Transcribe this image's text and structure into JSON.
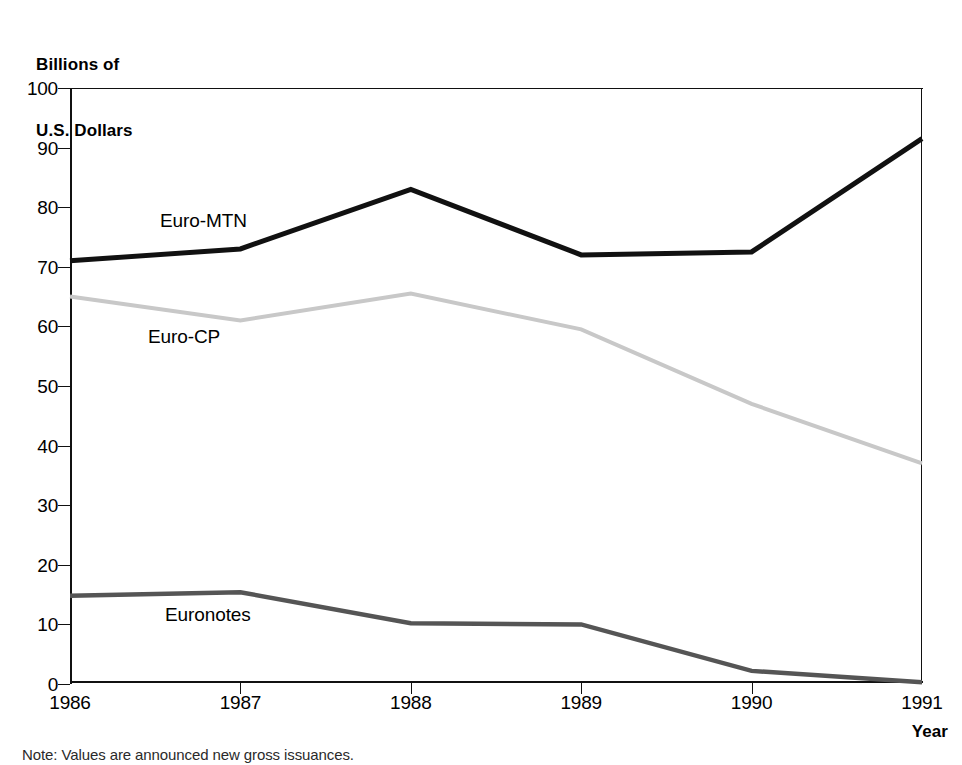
{
  "figure": {
    "y_axis_caption_line1": "Billions of",
    "y_axis_caption_line2": "U.S. Dollars",
    "x_axis_title": "Year",
    "footnote": "Note: Values are announced new gross issuances."
  },
  "series_labels": {
    "euro_mtn": "Euro-MTN",
    "euro_cp": "Euro-CP",
    "euronotes": "Euronotes"
  },
  "colors": {
    "euro_mtn": "#111111",
    "euro_cp": "#c8c8c8",
    "euronotes": "#555555",
    "axis": "#111111",
    "background": "#ffffff"
  },
  "chart_data": {
    "type": "line",
    "title": "",
    "subtitle": "",
    "xlabel": "Year",
    "ylabel": "Billions of U.S. Dollars",
    "categories": [
      "1986",
      "1987",
      "1988",
      "1989",
      "1990",
      "1991"
    ],
    "x": [
      1986,
      1987,
      1988,
      1989,
      1990,
      1991
    ],
    "xlim": [
      1986,
      1991
    ],
    "ylim": [
      0,
      100
    ],
    "yticks": [
      0,
      10,
      20,
      30,
      40,
      50,
      60,
      70,
      80,
      90,
      100
    ],
    "ytick_labels": [
      "0",
      "10",
      "20",
      "30",
      "40",
      "50",
      "60",
      "70",
      "80",
      "90",
      "100"
    ],
    "xtick_labels": [
      "1986",
      "1987",
      "1988",
      "1989",
      "1990",
      "1991"
    ],
    "grid": false,
    "legend": "inline-annotations",
    "series": [
      {
        "name": "Euro-MTN",
        "color": "#111111",
        "width": 5,
        "values": [
          71,
          73,
          83,
          72,
          72.5,
          91.5
        ]
      },
      {
        "name": "Euro-CP",
        "color": "#c8c8c8",
        "width": 4,
        "values": [
          65,
          61,
          65.5,
          59.5,
          47,
          37
        ]
      },
      {
        "name": "Euronotes",
        "color": "#555555",
        "width": 4.5,
        "values": [
          14.8,
          15.4,
          10.2,
          10,
          2.2,
          0.3
        ]
      }
    ],
    "annotations": [
      {
        "text": "Euro-MTN",
        "x": 1987,
        "y": 77
      },
      {
        "text": "Euro-CP",
        "x": 1987,
        "y": 57
      },
      {
        "text": "Euronotes",
        "x": 1987,
        "y": 11
      }
    ],
    "note": "Note: Values are announced new gross issuances."
  }
}
